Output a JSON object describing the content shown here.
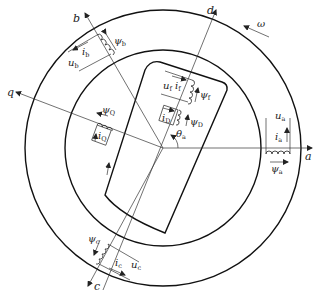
{
  "axes": {
    "a": "a",
    "b": "b",
    "c": "c",
    "d": "d",
    "q": "q"
  },
  "rotation": {
    "symbol": "ω"
  },
  "angle": {
    "symbol": "θ",
    "sub": "a"
  },
  "stator_windings": {
    "a": {
      "voltage": "u",
      "voltage_sub": "a",
      "current": "i",
      "current_sub": "a",
      "flux": "ψ",
      "flux_sub": "a"
    },
    "b": {
      "voltage": "u",
      "voltage_sub": "b",
      "current": "i",
      "current_sub": "b",
      "flux": "ψ",
      "flux_sub": "b"
    },
    "c": {
      "voltage": "u",
      "voltage_sub": "c",
      "current": "i",
      "current_sub": "c",
      "flux": "ψ",
      "flux_sub": "c"
    }
  },
  "rotor_windings": {
    "field": {
      "voltage": "u",
      "voltage_sub": "f",
      "current": "i",
      "current_sub": "f",
      "flux": "ψ",
      "flux_sub": "f"
    },
    "damper_d": {
      "current": "i",
      "current_sub": "D",
      "flux": "ψ",
      "flux_sub": "D"
    },
    "damper_q": {
      "current": "i",
      "current_sub": "Q",
      "flux": "ψ",
      "flux_sub": "Q"
    }
  },
  "geometry": {
    "center": [
      163,
      148
    ],
    "outer_radius": 138,
    "inner_radius": 98
  }
}
